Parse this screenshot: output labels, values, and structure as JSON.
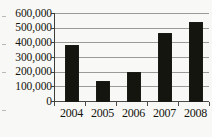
{
  "chart_data": {
    "type": "bar",
    "title": "",
    "subtitle": "",
    "xlabel": "",
    "ylabel": "",
    "categories": [
      "2004",
      "2005",
      "2006",
      "2007",
      "2008"
    ],
    "values": [
      385000,
      138000,
      198000,
      468000,
      540000
    ],
    "series": [
      {
        "name": "",
        "values": [
          385000,
          138000,
          198000,
          468000,
          540000
        ]
      }
    ],
    "ylim": [
      0,
      600000
    ],
    "ytick_values": [
      0,
      100000,
      200000,
      300000,
      400000,
      500000,
      600000
    ],
    "ytick_labels": [
      "0",
      "100,000",
      "200,000",
      "300,000",
      "400,000",
      "500,000",
      "600,000"
    ],
    "xtick_labels": [
      "2004",
      "2005",
      "2006",
      "2007",
      "2008"
    ],
    "grid": true,
    "grid_axis": "y",
    "legend": false,
    "legend_position": "none",
    "annotations": [],
    "colors": {
      "bar": "#15150f",
      "gridline": "#9a9a96",
      "axis": "#3d3d39",
      "background": "#f8f8f6",
      "text": "#15150f"
    }
  }
}
